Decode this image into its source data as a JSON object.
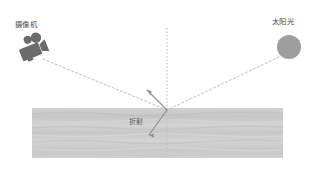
{
  "canvas": {
    "width": 317,
    "height": 179,
    "background": "#ffffff"
  },
  "title": "",
  "labels": {
    "camera": "摄像机",
    "sun": "太阳光",
    "refraction": "折射"
  },
  "icons": {
    "camera": "camcorder-icon",
    "sun": "sun-circle-icon"
  },
  "colors": {
    "camera_icon": "#6e6e6e",
    "sun_circle": "#9a9a9a",
    "water_band": "#c9c9c9",
    "water_band_light": "#d8d8d8",
    "ray_dotted": "#b8b8b8",
    "ray_solid": "#8a8a8a",
    "normal_line": "#bdbdbd",
    "label_text": "#4a4a4a",
    "background": "#ffffff"
  },
  "geometry": {
    "water_band": {
      "x": 32,
      "y": 108,
      "width": 251,
      "height": 50
    },
    "normal_line": {
      "x": 167,
      "y_top": 28,
      "y_bottom": 155
    },
    "intersection": {
      "x": 167,
      "y": 110
    },
    "sun_circle": {
      "cx": 289,
      "cy": 47,
      "r": 12
    },
    "camera_icon": {
      "x": 15,
      "y": 32,
      "width": 36,
      "height": 32
    }
  },
  "rays": [
    {
      "name": "incident-ray",
      "style": "dotted",
      "from": {
        "x": 279,
        "y": 57
      },
      "to": {
        "x": 167,
        "y": 110
      }
    },
    {
      "name": "reflected-ray",
      "style": "dotted",
      "from": {
        "x": 167,
        "y": 110
      },
      "to": {
        "x": 43,
        "y": 59
      }
    },
    {
      "name": "reflection-arrow",
      "style": "solid",
      "from": {
        "x": 167,
        "y": 110
      },
      "to": {
        "x": 146,
        "y": 89
      }
    },
    {
      "name": "refracted-ray",
      "style": "solid",
      "from": {
        "x": 167,
        "y": 110
      },
      "to": {
        "x": 148,
        "y": 136
      }
    }
  ]
}
